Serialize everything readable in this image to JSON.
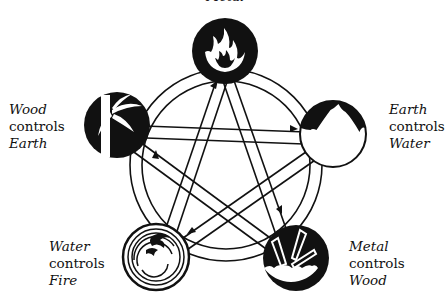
{
  "title_partial": "Metal",
  "elements": [
    {
      "name": "Fire",
      "icon": "flame-icon"
    },
    {
      "name": "Earth",
      "icon": "mountain-icon"
    },
    {
      "name": "Metal",
      "icon": "crystal-icon"
    },
    {
      "name": "Water",
      "icon": "wave-icon"
    },
    {
      "name": "Wood",
      "icon": "bamboo-icon"
    }
  ],
  "labels": {
    "wood": {
      "subject": "Wood",
      "verb": "controls",
      "object": "Earth"
    },
    "earth": {
      "subject": "Earth",
      "verb": "controls",
      "object": "Water"
    },
    "water": {
      "subject": "Water",
      "verb": "controls",
      "object": "Fire"
    },
    "metal": {
      "subject": "Metal",
      "verb": "controls",
      "object": "Wood"
    }
  },
  "colors": {
    "ink": "#111111",
    "paper": "#ffffff"
  }
}
